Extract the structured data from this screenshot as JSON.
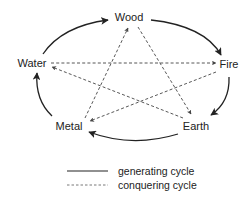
{
  "diagram": {
    "nodes": [
      {
        "id": "wood",
        "label": "Wood",
        "x": 125,
        "y": 21
      },
      {
        "id": "fire",
        "label": "Fire",
        "x": 228,
        "y": 68
      },
      {
        "id": "earth",
        "label": "Earth",
        "x": 196,
        "y": 130
      },
      {
        "id": "metal",
        "label": "Metal",
        "x": 64,
        "y": 130
      },
      {
        "id": "water",
        "label": "Water",
        "x": 31,
        "y": 67
      }
    ],
    "generating_cycle": [
      {
        "from": "Water",
        "to": "Wood"
      },
      {
        "from": "Wood",
        "to": "Fire"
      },
      {
        "from": "Fire",
        "to": "Earth"
      },
      {
        "from": "Earth",
        "to": "Metal"
      },
      {
        "from": "Metal",
        "to": "Water"
      }
    ],
    "conquering_cycle": [
      {
        "from": "Wood",
        "to": "Earth"
      },
      {
        "from": "Earth",
        "to": "Water"
      },
      {
        "from": "Water",
        "to": "Fire"
      },
      {
        "from": "Fire",
        "to": "Metal"
      },
      {
        "from": "Metal",
        "to": "Wood"
      }
    ]
  },
  "legend": {
    "solid_label": "generating cycle",
    "dashed_label": "conquering cycle"
  }
}
